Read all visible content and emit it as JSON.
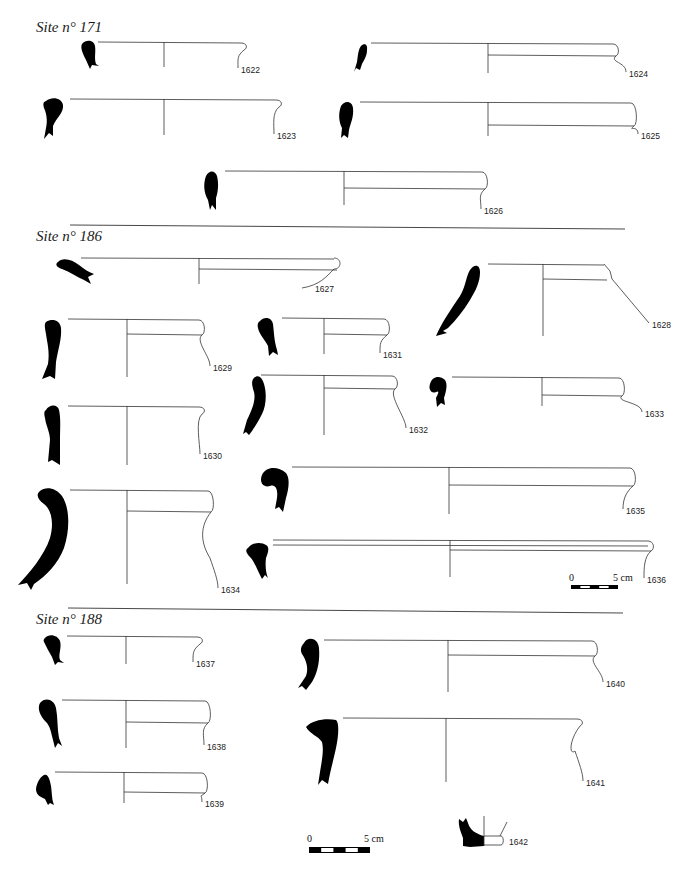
{
  "plate": {
    "width": 689,
    "height": 874,
    "ink_color": "#000000",
    "line_color": "#333333",
    "background": "#ffffff"
  },
  "sections": [
    {
      "title": "Site n° 171",
      "title_pos": [
        36,
        29
      ],
      "separator": null
    },
    {
      "title": "Site n° 186",
      "title_pos": [
        36,
        238
      ],
      "separator": [
        70,
        225,
        625,
        229
      ]
    },
    {
      "title": "Site n° 188",
      "title_pos": [
        36,
        621
      ],
      "separator": [
        68,
        608,
        623,
        613
      ]
    }
  ],
  "sherds": [
    {
      "id": "1622",
      "site": "171",
      "rim_y": 42,
      "x_left": 98,
      "x_axis": 164,
      "x_right": 247,
      "axis_bottom": 67,
      "inner_y": null,
      "label_pos": [
        241,
        71
      ],
      "wall": "s-short",
      "profile": "M82 44 C86 39,94 40,95 46 C96 52,94 58,96 64 L99 66 L92 65 L90 69 L86 60 C83 54,80 48,82 44 Z"
    },
    {
      "id": "1623",
      "site": "171",
      "rim_y": 99,
      "x_left": 70,
      "x_axis": 164,
      "x_right": 282,
      "axis_bottom": 135,
      "inner_y": null,
      "label_pos": [
        277,
        137
      ],
      "wall": "s-long",
      "profile": "M46 101 C52 96,62 98,63 105 C64 113,56 118,53 126 L53 136 L49 133 L44 139 L46 128 C48 120,46 112,44 108 C43 104,43 102,46 101 Z"
    },
    {
      "id": "1624",
      "site": "171",
      "rim_y": 43,
      "x_left": 371,
      "x_axis": 488,
      "x_right": 619,
      "axis_bottom": 73,
      "inner_y": 55,
      "label_pos": [
        629,
        75
      ],
      "wall": "taper",
      "profile": "M361 46 C364 43,368 44,367 50 C367 56,364 60,362 64 L360 70 L356 68 L354 72 L357 62 C358 56,358 50,361 46 Z"
    },
    {
      "id": "1625",
      "site": "171",
      "rim_y": 102,
      "x_left": 360,
      "x_axis": 488,
      "x_right": 637,
      "axis_bottom": 136,
      "inner_y": 125,
      "label_pos": [
        641,
        137
      ],
      "wall": "bead",
      "profile": "M341 106 C345 100,352 101,353 108 C354 118,350 124,349 130 L348 138 L344 135 L341 138 L342 128 C339 122,338 114,341 106 Z"
    },
    {
      "id": "1626",
      "site": "171",
      "rim_y": 171,
      "x_left": 225,
      "x_axis": 344,
      "x_right": 488,
      "axis_bottom": 205,
      "inner_y": 188,
      "label_pos": [
        484,
        212
      ],
      "wall": "bead-long",
      "profile": "M206 176 C209 170,215 170,217 176 C219 184,218 192,216 198 L216 210 L212 205 L210 210 L208 200 C204 193,203 184,206 176 Z"
    },
    {
      "id": "1627",
      "site": "186",
      "rim_y": 258,
      "x_left": 81,
      "x_axis": 199,
      "x_right": 340,
      "axis_bottom": 284,
      "inner_y": 269,
      "label_pos": [
        315,
        290
      ],
      "wall": "flat-round",
      "profile": "M58 262 C62 257,72 259,79 265 C84 269,88 272,94 274 L88 277 L91 284 L84 280 C77 277,70 272,62 269 C56 267,55 264,58 262 Z"
    },
    {
      "id": "1628",
      "site": "186",
      "rim_y": 264,
      "x_left": 488,
      "x_axis": 543,
      "x_right": 610,
      "axis_bottom": 336,
      "inner_y": 279,
      "label_pos": [
        652,
        326
      ],
      "wall": "flare",
      "profile": "M470 270 C474 264,480 264,480 272 C480 282,476 290,470 300 C464 310,456 320,448 328 L443 331 L447 333 L436 336 C442 322,452 308,460 296 C466 286,466 276,470 270 Z"
    },
    {
      "id": "1629",
      "site": "186",
      "rim_y": 319,
      "x_left": 68,
      "x_axis": 127,
      "x_right": 205,
      "axis_bottom": 377,
      "inner_y": 334,
      "label_pos": [
        213,
        369
      ],
      "wall": "s-long",
      "profile": "M46 322 C52 318,60 320,61 328 C62 338,58 350,56 362 L55 379 L50 376 L42 379 L48 364 C50 352,47 342,46 334 C45 328,44 324,46 322 Z"
    },
    {
      "id": "1630",
      "site": "186",
      "rim_y": 406,
      "x_left": 68,
      "x_axis": 127,
      "x_right": 205,
      "axis_bottom": 465,
      "inner_y": null,
      "label_pos": [
        203,
        457
      ],
      "wall": "s-long",
      "profile": "M46 410 C49 404,58 404,59 410 C61 418,60 430,60 442 L60 465 L52 460 L48 462 L50 440 C50 432,46 426,45 418 C44 414,44 411,46 410 Z"
    },
    {
      "id": "1631",
      "site": "186",
      "rim_y": 318,
      "x_left": 282,
      "x_axis": 324,
      "x_right": 390,
      "axis_bottom": 354,
      "inner_y": 334,
      "label_pos": [
        383,
        356
      ],
      "wall": "s-short",
      "profile": "M260 321 C264 316,272 317,273 324 C274 332,274 340,277 350 L278 355 L273 352 L269 356 L268 346 C265 340,259 334,258 328 C257 325,258 322,260 321 Z"
    },
    {
      "id": "1632",
      "site": "186",
      "rim_y": 375,
      "x_left": 261,
      "x_axis": 324,
      "x_right": 398,
      "axis_bottom": 435,
      "inner_y": 388,
      "label_pos": [
        409,
        431
      ],
      "wall": "s-long",
      "profile": "M254 378 C258 374,262 377,264 384 C267 394,266 406,262 414 C258 422,254 428,252 431 L249 435 L246 432 L243 434 L247 420 C252 410,256 400,254 392 C252 386,251 381,254 378 Z"
    },
    {
      "id": "1633",
      "site": "186",
      "rim_y": 377,
      "x_left": 452,
      "x_axis": 542,
      "x_right": 625,
      "axis_bottom": 406,
      "inner_y": 395,
      "label_pos": [
        645,
        415
      ],
      "wall": "bead",
      "profile": "M430 384 C432 376,440 375,445 380 C448 384,446 392,444 398 L445 405 L441 403 L437 407 L436 398 C438 394,440 390,436 392 C432 394,428 390,430 384 Z"
    },
    {
      "id": "1634",
      "site": "186",
      "rim_y": 490,
      "x_left": 70,
      "x_axis": 127,
      "x_right": 214,
      "axis_bottom": 584,
      "inner_y": 511,
      "label_pos": [
        221,
        591
      ],
      "wall": "deep-s",
      "profile": "M40 491 C46 486,56 488,62 496 C70 508,70 530,64 548 C58 564,46 576,34 584 L31 590 L27 583 L18 585 C30 572,44 556,50 538 C54 524,52 510,44 504 C37 499,36 494,40 491 Z"
    },
    {
      "id": "1635",
      "site": "186",
      "rim_y": 467,
      "x_left": 292,
      "x_axis": 449,
      "x_right": 636,
      "axis_bottom": 514,
      "inner_y": 485,
      "label_pos": [
        626,
        512
      ],
      "wall": "bead-long",
      "profile": "M262 475 C266 466,278 466,286 473 C290 478,289 488,286 498 L283 512 L279 507 L275 509 L277 498 C278 490,276 484,270 486 C263 488,259 482,262 475 Z"
    },
    {
      "id": "1636",
      "site": "186",
      "rim_y": 540,
      "x_left": 273,
      "x_axis": 450,
      "x_right": 654,
      "axis_bottom": 577,
      "inner_y": 550,
      "double_rim": true,
      "label_pos": [
        647,
        581
      ],
      "wall": "bead",
      "profile": "M248 548 C252 542,262 542,266 545 C270 547,268 553,266 558 C265 566,266 574,268 578 L265 575 L262 579 L259 573 C256 567,254 561,250 557 C246 553,245 550,248 548 Z"
    },
    {
      "id": "1637",
      "site": "188",
      "rim_y": 636,
      "x_left": 67,
      "x_axis": 126,
      "x_right": 203,
      "axis_bottom": 664,
      "inner_y": null,
      "label_pos": [
        196,
        665
      ],
      "wall": "s-short",
      "profile": "M45 638 C49 633,58 635,60 641 C62 648,58 654,60 660 L64 663 L58 662 L55 665 L52 657 C49 652,46 646,44 642 C43 640,44 639,45 638 Z"
    },
    {
      "id": "1638",
      "site": "188",
      "rim_y": 700,
      "x_left": 62,
      "x_axis": 126,
      "x_right": 211,
      "axis_bottom": 748,
      "inner_y": 722,
      "label_pos": [
        207,
        748
      ],
      "wall": "bead",
      "profile": "M40 703 C45 697,54 699,56 708 C58 718,57 728,59 738 L62 746 L58 743 L55 748 L53 740 C51 732,50 726,46 722 C40 716,37 708,40 703 Z"
    },
    {
      "id": "1639",
      "site": "188",
      "rim_y": 772,
      "x_left": 55,
      "x_axis": 124,
      "x_right": 208,
      "axis_bottom": 803,
      "inner_y": 792,
      "label_pos": [
        205,
        805
      ],
      "wall": "bead",
      "profile": "M44 775 C48 773,50 780,51 786 C52 794,52 798,53 802 L54 805 L50 803 L48 805 L45 799 C41 797,37 796,36 790 C36 784,40 777,44 775 Z"
    },
    {
      "id": "1640",
      "site": "188",
      "rim_y": 640,
      "x_left": 324,
      "x_axis": 448,
      "x_right": 598,
      "axis_bottom": 692,
      "inner_y": 655,
      "label_pos": [
        606,
        685
      ],
      "wall": "bead-long",
      "profile": "M304 643 C308 636,318 638,319 648 C320 660,318 672,312 682 L306 690 L302 686 L298 688 L306 676 C309 668,306 660,302 654 C300 650,301 646,304 643 Z"
    },
    {
      "id": "1641",
      "site": "188",
      "rim_y": 718,
      "x_left": 343,
      "x_axis": 446,
      "x_right": 583,
      "axis_bottom": 782,
      "inner_y": null,
      "label_pos": [
        586,
        784
      ],
      "wall": "deep-s",
      "profile": "M306 727 C312 720,326 718,336 720 C339 722,339 734,336 748 C333 762,330 772,328 784 L322 780 L318 785 L320 772 C322 760,324 750,322 742 C318 736,310 734,306 727 Z"
    },
    {
      "id": "1642",
      "site": "188",
      "label_pos": [
        509,
        843
      ],
      "wall": "base"
    }
  ],
  "scale_bars": [
    {
      "start_label": "0",
      "end_label": "5 cm",
      "x": 571,
      "y": 585,
      "width": 47,
      "height": 4,
      "label_y": 574
    },
    {
      "start_label": "0",
      "end_label": "5 cm",
      "x": 309,
      "y": 847,
      "width": 61,
      "height": 6,
      "label_y": 832
    }
  ]
}
